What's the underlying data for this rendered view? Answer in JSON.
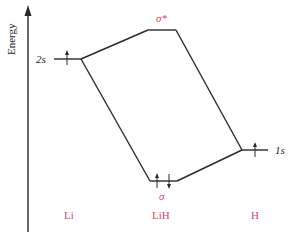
{
  "axis": {
    "label": "Energy"
  },
  "levels": {
    "li_2s": {
      "label": "2s",
      "electrons": [
        "up"
      ]
    },
    "sigma_star": {
      "label": "σ*",
      "electrons": []
    },
    "sigma": {
      "label": "σ",
      "electrons": [
        "up",
        "down"
      ]
    },
    "h_1s": {
      "label": "1s",
      "electrons": [
        "up"
      ]
    }
  },
  "columns": {
    "li": "Li",
    "lih": "LiH",
    "h": "H"
  },
  "colors": {
    "accent": "#e04060",
    "line": "#2a2a2a"
  }
}
